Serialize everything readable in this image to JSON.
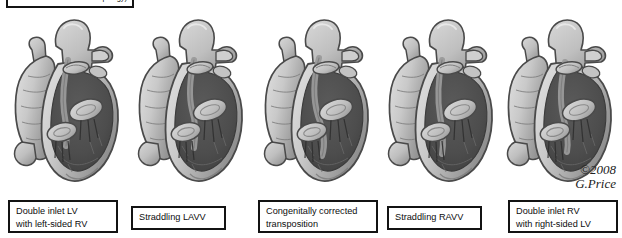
{
  "figure": {
    "background_color": "#ffffff",
    "border_color": "#131313",
    "top_caption": {
      "text": "univentricular  ventricular topology)",
      "clipped": true
    },
    "credit": {
      "line1": "©2008",
      "line2": "G.Price"
    }
  },
  "panels": [
    {
      "index": 1,
      "icon": "heart-cross-section-illustration",
      "label": {
        "lines": [
          "Double inlet LV",
          "with left-sided RV"
        ],
        "x": 8,
        "y": 200,
        "width": 110,
        "height": 33
      }
    },
    {
      "index": 2,
      "icon": "heart-cross-section-illustration",
      "label": {
        "lines": [
          "Straddling LAVV"
        ],
        "x": 131,
        "y": 206,
        "width": 95,
        "height": 24
      }
    },
    {
      "index": 3,
      "icon": "heart-cross-section-illustration",
      "label": {
        "lines": [
          "Congenitally corrected",
          "transposition"
        ],
        "x": 258,
        "y": 200,
        "width": 120,
        "height": 33
      }
    },
    {
      "index": 4,
      "icon": "heart-cross-section-illustration",
      "label": {
        "lines": [
          "Straddling RAVV"
        ],
        "x": 387,
        "y": 206,
        "width": 95,
        "height": 24
      }
    },
    {
      "index": 5,
      "icon": "heart-cross-section-illustration",
      "label": {
        "lines": [
          "Double inlet RV",
          "with right-sided LV"
        ],
        "x": 508,
        "y": 200,
        "width": 110,
        "height": 33
      }
    }
  ],
  "palette": {
    "outline": "#4a4a4a",
    "myocardium_light": "#c9c9c9",
    "myocardium_mid": "#a8a8a8",
    "myocardium_dark": "#8d8d8d",
    "cavity_dark": "#4d4d4d",
    "cavity_darker": "#3d3d3d",
    "valve_light": "#bdbdbd",
    "vessel_light": "#bfbfbf",
    "highlight": "#e2e2e2"
  }
}
